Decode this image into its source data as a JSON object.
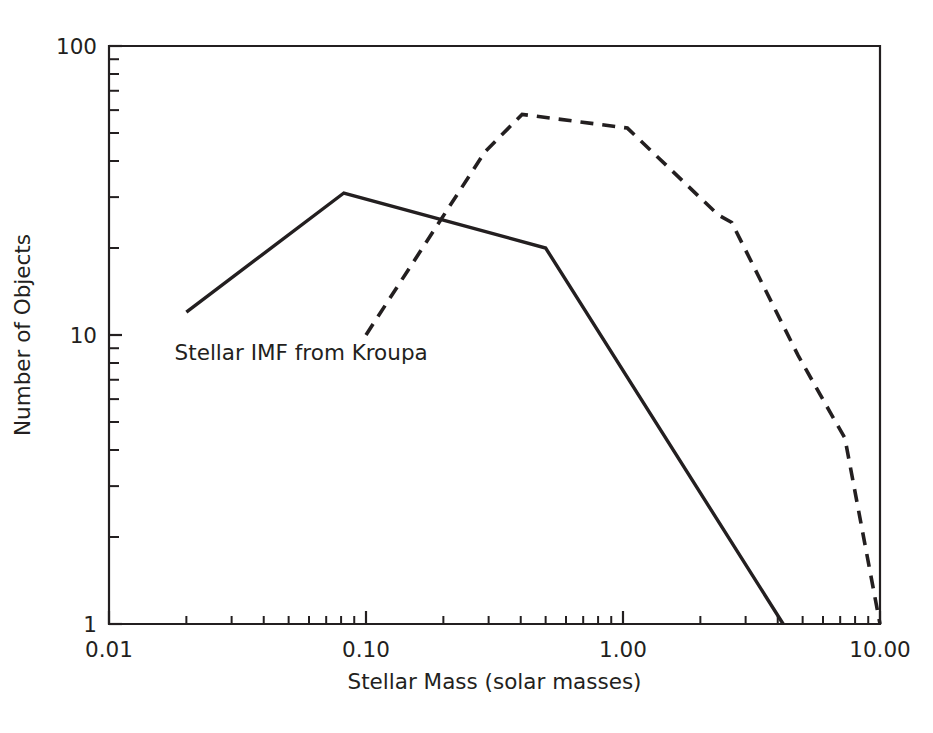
{
  "chart_data": {
    "type": "line",
    "title": "",
    "xlabel": "Stellar Mass (solar masses)",
    "ylabel": "Number of Objects",
    "xscale": "log",
    "yscale": "log",
    "xlim": [
      0.01,
      10.0
    ],
    "ylim": [
      1,
      100
    ],
    "grid": false,
    "legend": "none",
    "xtick_labels": [
      "0.01",
      "0.10",
      "1.00",
      "10.00"
    ],
    "xtick_values": [
      0.01,
      0.1,
      1.0,
      10.0
    ],
    "ytick_labels": [
      "1",
      "10",
      "100"
    ],
    "ytick_values": [
      1,
      10,
      100
    ],
    "annotations": [
      {
        "name": "stellar-imf-kroupa-label",
        "text": "Stellar IMF from Kroupa",
        "x": 0.018,
        "y": 8.2
      }
    ],
    "series": [
      {
        "name": "Stellar IMF from Kroupa",
        "style": "solid",
        "color": "#231f20",
        "points": [
          [
            0.02,
            12.0
          ],
          [
            0.082,
            31.0
          ],
          [
            0.5,
            20.0
          ],
          [
            4.2,
            1.0
          ]
        ]
      },
      {
        "name": "Observed mass function",
        "style": "dashed",
        "color": "#231f20",
        "points": [
          [
            0.1,
            10.0
          ],
          [
            0.29,
            43.0
          ],
          [
            0.405,
            58.0
          ],
          [
            1.04,
            52.0
          ],
          [
            2.35,
            26.0
          ],
          [
            2.65,
            24.5
          ],
          [
            4.8,
            8.5
          ],
          [
            6.4,
            5.4
          ],
          [
            7.3,
            4.4
          ],
          [
            10.0,
            1.0
          ]
        ]
      }
    ]
  },
  "axes": {
    "x_title": "Stellar Mass (solar masses)",
    "y_title": "Number of Objects",
    "x_labels": [
      "0.01",
      "0.10",
      "1.00",
      "10.00"
    ],
    "y_labels": [
      "100",
      "10",
      "1"
    ]
  },
  "annotation": {
    "kroupa": "Stellar IMF from Kroupa"
  },
  "colors": {
    "ink": "#231f20",
    "background": "#ffffff"
  }
}
